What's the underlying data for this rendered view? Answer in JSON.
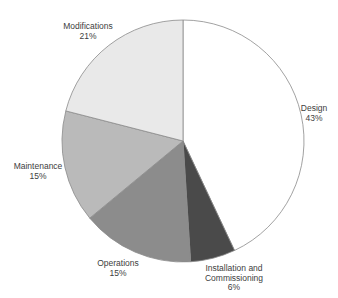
{
  "chart_data": {
    "type": "pie",
    "title": "",
    "start_angle": "12 o'clock",
    "direction": "clockwise",
    "categories": [
      "Design",
      "Installation and Commissioning",
      "Operations",
      "Maintenance",
      "Modifications"
    ],
    "values": [
      43,
      6,
      15,
      15,
      21
    ],
    "unit": "%",
    "colors": [
      "#ffffff",
      "#4a4a4a",
      "#8c8c8c",
      "#bababa",
      "#e9e9e9"
    ],
    "labels": [
      {
        "name": "Design",
        "value": "43%"
      },
      {
        "name_line1": "Installation and",
        "name_line2": "Commissioning",
        "value": "6%"
      },
      {
        "name": "Operations",
        "value": "15%"
      },
      {
        "name": "Maintenance",
        "value": "15%"
      },
      {
        "name": "Modifications",
        "value": "21%"
      }
    ],
    "legend": "none (data labels outside slices)"
  }
}
